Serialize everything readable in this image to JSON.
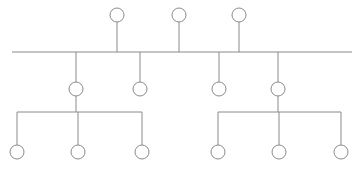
{
  "diagram": {
    "type": "node-link-tree",
    "canvas": {
      "width": 359,
      "height": 173,
      "background": "#ffffff"
    },
    "style": {
      "stroke_color": "#8a8a8a",
      "stroke_width": 1,
      "node_fill": "#ffffff",
      "node_radius": 7
    },
    "bus": {
      "name": "main-bus-line",
      "y": 52,
      "x_start": 12,
      "x_end": 352
    },
    "rows": {
      "top_row_label": "upper nodes",
      "second_row_label": "middle nodes",
      "bottom_row_label": "leaf nodes"
    },
    "nodes": {
      "top": [
        {
          "id": "top-node-1",
          "cx": 117,
          "cy": 15,
          "r": 7
        },
        {
          "id": "top-node-2",
          "cx": 179,
          "cy": 15,
          "r": 7
        },
        {
          "id": "top-node-3",
          "cx": 239,
          "cy": 15,
          "r": 7
        }
      ],
      "middle": [
        {
          "id": "middle-node-1",
          "cx": 76,
          "cy": 89,
          "r": 7,
          "has_children": true
        },
        {
          "id": "middle-node-2",
          "cx": 140,
          "cy": 89,
          "r": 7,
          "has_children": false
        },
        {
          "id": "middle-node-3",
          "cx": 219,
          "cy": 89,
          "r": 7,
          "has_children": false
        },
        {
          "id": "middle-node-4",
          "cx": 278,
          "cy": 89,
          "r": 7,
          "has_children": true
        }
      ],
      "bottom": [
        {
          "id": "leaf-node-1",
          "cx": 17,
          "cy": 152,
          "r": 7,
          "group": "left"
        },
        {
          "id": "leaf-node-2",
          "cx": 78,
          "cy": 152,
          "r": 7,
          "group": "left"
        },
        {
          "id": "leaf-node-3",
          "cx": 142,
          "cy": 152,
          "r": 7,
          "group": "left"
        },
        {
          "id": "leaf-node-4",
          "cx": 218,
          "cy": 152,
          "r": 7,
          "group": "right"
        },
        {
          "id": "leaf-node-5",
          "cx": 279,
          "cy": 152,
          "r": 7,
          "group": "right"
        },
        {
          "id": "leaf-node-6",
          "cx": 341,
          "cy": 152,
          "r": 7,
          "group": "right"
        }
      ]
    },
    "stems": {
      "top_to_bus": [
        {
          "id": "stem-top-1",
          "x": 117,
          "y1": 22,
          "y2": 52
        },
        {
          "id": "stem-top-2",
          "x": 179,
          "y1": 22,
          "y2": 52
        },
        {
          "id": "stem-top-3",
          "x": 239,
          "y1": 22,
          "y2": 52
        }
      ],
      "bus_to_middle": [
        {
          "id": "stem-mid-1",
          "x": 76,
          "y1": 52,
          "y2": 82
        },
        {
          "id": "stem-mid-2",
          "x": 140,
          "y1": 52,
          "y2": 82
        },
        {
          "id": "stem-mid-3",
          "x": 219,
          "y1": 52,
          "y2": 82
        },
        {
          "id": "stem-mid-4",
          "x": 278,
          "y1": 52,
          "y2": 82
        }
      ],
      "middle_to_bar": [
        {
          "id": "stem-drop-left",
          "x": 76,
          "y1": 96,
          "y2": 112
        },
        {
          "id": "stem-drop-right",
          "x": 278,
          "y1": 96,
          "y2": 112
        }
      ],
      "bar_to_leaf": [
        {
          "id": "stem-leaf-1",
          "x": 17,
          "y1": 112,
          "y2": 145
        },
        {
          "id": "stem-leaf-2",
          "x": 78,
          "y1": 112,
          "y2": 145
        },
        {
          "id": "stem-leaf-3",
          "x": 142,
          "y1": 112,
          "y2": 145
        },
        {
          "id": "stem-leaf-4",
          "x": 218,
          "y1": 112,
          "y2": 145
        },
        {
          "id": "stem-leaf-5",
          "x": 279,
          "y1": 112,
          "y2": 145
        },
        {
          "id": "stem-leaf-6",
          "x": 341,
          "y1": 112,
          "y2": 145
        }
      ]
    },
    "group_bars": [
      {
        "id": "group-bar-left",
        "y": 112,
        "x_start": 17,
        "x_end": 142
      },
      {
        "id": "group-bar-right",
        "y": 112,
        "x_start": 218,
        "x_end": 341
      }
    ],
    "counts": {
      "top_nodes": 3,
      "middle_nodes": 4,
      "bottom_nodes": 6,
      "total_nodes": 13
    }
  }
}
